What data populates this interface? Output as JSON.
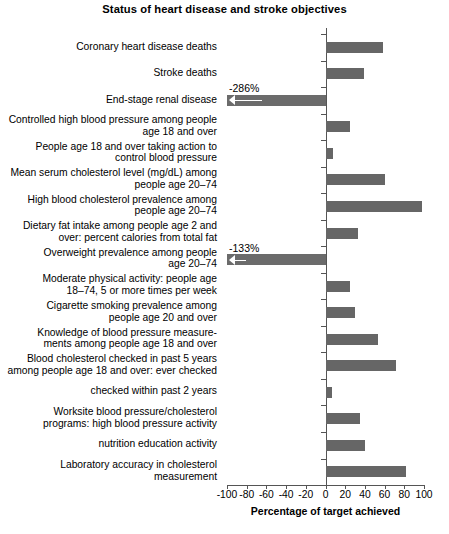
{
  "chart_data": {
    "type": "bar",
    "orientation": "horizontal",
    "title": "Status of heart disease and stroke objectives",
    "xlabel": "Percentage of target achieved",
    "ylabel": "",
    "xlim": [
      -100,
      100
    ],
    "xticks": [
      -100,
      -80,
      -60,
      -40,
      -20,
      0,
      20,
      40,
      60,
      80,
      100
    ],
    "xticklabels": [
      "-100",
      "-80",
      "-60",
      "-40",
      "-20",
      "0",
      "20",
      "40",
      "60",
      "80",
      "100"
    ],
    "grid": false,
    "legend": null,
    "bar_color": "#666666",
    "axis_color": "#555555",
    "categories": [
      "Coronary heart disease deaths",
      "Stroke deaths",
      "End-stage renal disease",
      "Controlled high blood pressure among people\nage 18 and over",
      "People age 18 and over taking action to\ncontrol blood pressure",
      "Mean serum cholesterol level (mg/dL) among\npeople age 20–74",
      "High blood cholesterol prevalence among\npeople age 20–74",
      "Dietary fat intake among people age 2 and\nover: percent calories from total fat",
      "Overweight prevalence among people\nage 20–74",
      "Moderate physical activity: people age\n18–74, 5 or more times per week",
      "Cigarette smoking prevalence among\npeople age 20 and over",
      "Knowledge of blood pressure measure-\nments among people age 18 and over",
      "Blood cholesterol checked in past 5 years\namong people age 18 and over: ever checked",
      "checked within past 2 years",
      "Worksite blood pressure/cholesterol\nprograms: high blood pressure activity",
      "nutrition education activity",
      "Laboratory accuracy in cholesterol\nmeasurement"
    ],
    "values": [
      58,
      39,
      -286,
      25,
      8,
      60,
      98,
      33,
      -133,
      25,
      30,
      53,
      72,
      7,
      35,
      40,
      82
    ],
    "annotations": [
      {
        "category": "End-stage renal disease",
        "text": "-286%",
        "value": -286,
        "clipped": true
      },
      {
        "category": "Overweight prevalence among people age 20–74",
        "text": "-133%",
        "value": -133,
        "clipped": true
      }
    ]
  }
}
